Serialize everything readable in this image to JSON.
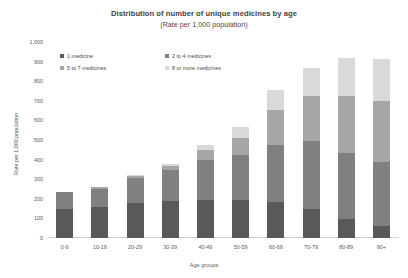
{
  "chart_data": {
    "type": "bar",
    "title": "Distribution of number of unique medicines by age",
    "subtitle": "(Rate per 1,000 population)",
    "xlabel": "Age groups",
    "ylabel": "Rate per 1,000 population",
    "ylim": [
      0,
      1000
    ],
    "yticks": [
      "0",
      "100",
      "200",
      "300",
      "400",
      "500",
      "600",
      "700",
      "800",
      "900",
      "1,000"
    ],
    "grid": false,
    "stacked": true,
    "legend_position": "top-left",
    "categories": [
      "0-9",
      "10-19",
      "20-29",
      "30-39",
      "40-49",
      "50-59",
      "60-69",
      "70-79",
      "80-89",
      "90+"
    ],
    "series": [
      {
        "name": "1 medicine",
        "color": "#595959",
        "values": [
          150,
          160,
          180,
          190,
          195,
          195,
          185,
          150,
          95,
          60
        ]
      },
      {
        "name": "2 to 4 medicines",
        "color": "#808080",
        "values": [
          83,
          90,
          125,
          155,
          205,
          230,
          290,
          345,
          340,
          330
        ]
      },
      {
        "name": "5 to 7 medicines",
        "color": "#a6a6a6",
        "values": [
          2,
          8,
          13,
          25,
          50,
          85,
          180,
          230,
          290,
          310
        ]
      },
      {
        "name": "8 or more medicines",
        "color": "#d9d9d9",
        "values": [
          0,
          2,
          2,
          10,
          25,
          55,
          100,
          145,
          195,
          215
        ]
      }
    ],
    "totals": [
      235,
      260,
      320,
      380,
      475,
      565,
      755,
      870,
      920,
      915
    ]
  },
  "legend": {
    "items": [
      {
        "label": "1 medicine",
        "color": "#595959"
      },
      {
        "label": "2 to 4 medicines",
        "color": "#808080"
      },
      {
        "label": "5 to 7 medicines",
        "color": "#a6a6a6"
      },
      {
        "label": "8 or more medicines",
        "color": "#d9d9d9"
      }
    ]
  }
}
